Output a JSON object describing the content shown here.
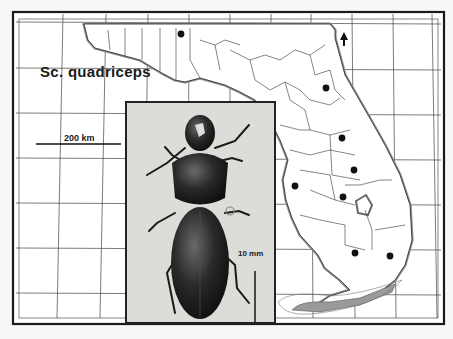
{
  "map": {
    "species_label": "Sc. quadriceps",
    "map_scale_label": "200 km",
    "photo_scale_label": "10 mm",
    "north_arrow": "north-arrow-icon",
    "region": "Florida",
    "frame_ticks_top": [
      "88",
      "87",
      "86",
      "85",
      "84",
      "83",
      "82",
      "81",
      "80",
      "79"
    ],
    "frame_ticks_bottom": [
      "88",
      "87",
      "82",
      "81",
      "80"
    ],
    "record_dots": [
      {
        "x": 181,
        "y": 34
      },
      {
        "x": 326,
        "y": 88
      },
      {
        "x": 342,
        "y": 138
      },
      {
        "x": 354,
        "y": 170
      },
      {
        "x": 295,
        "y": 186
      },
      {
        "x": 343,
        "y": 197
      },
      {
        "x": 355,
        "y": 253
      },
      {
        "x": 390,
        "y": 256
      }
    ],
    "colors": {
      "ink": "#1a1a1a",
      "paper": "#f7f7f5",
      "photo_bg": "#dcdcd8",
      "coast_shade": "#8a8a8a"
    }
  },
  "photo": {
    "subject": "ground beetle specimen (dorsal view)"
  }
}
